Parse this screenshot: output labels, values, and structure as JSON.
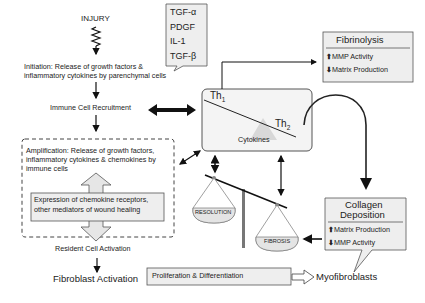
{
  "left_flow": {
    "injury": "INJURY",
    "initiation_line1": "Initiation: Release of growth factors &",
    "initiation_line2": "inflammatory cytokines by parenchymal cells",
    "immune_recruitment": "Immune Cell Recruitment",
    "amplification_line1": "Amplification: Release of growth factors,",
    "amplification_line2": "inflammatory cytokines & chemokines by",
    "amplification_line3": "immune cells",
    "expression_line1": "Expression of chemokine receptors,",
    "expression_line2": "other mediators of wound healing",
    "resident_activation": "Resident Cell Activation",
    "fibroblast_activation": "Fibroblast Activation",
    "proliferation": "Proliferation & Differentiation",
    "myofibroblasts": "Myofibroblasts"
  },
  "growth_factors": {
    "items": [
      "TGF-α",
      "PDGF",
      "IL-1",
      "TGF-β"
    ]
  },
  "cytokine_box": {
    "th1_main": "Th",
    "th1_sub": "1",
    "th2_main": "Th",
    "th2_sub": "2",
    "label": "Cytokines"
  },
  "fibrinolysis": {
    "title": "Fibrinolysis",
    "items": [
      {
        "direction": "up",
        "label": "MMP Activity"
      },
      {
        "direction": "down",
        "label": "Matrix Production"
      }
    ]
  },
  "collagen": {
    "title_line1": "Collagen",
    "title_line2": "Deposition",
    "items": [
      {
        "direction": "up",
        "label": "Matrix Production"
      },
      {
        "direction": "down",
        "label": "MMP Activity"
      }
    ]
  },
  "balance": {
    "left_pan": "RESOLUTION",
    "right_pan": "FIBROSIS"
  },
  "colors": {
    "box_fill": "#eeeeee",
    "stroke": "#222222",
    "pan_fill": "#e4e4e4"
  }
}
